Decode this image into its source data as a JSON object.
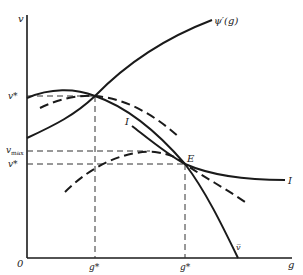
{
  "diagram": {
    "type": "economics-curve-diagram",
    "axes": {
      "y_label": "v",
      "x_label": "g",
      "origin_label": "0"
    },
    "y_ticks": [
      {
        "label": "v*",
        "id": "v-star-upper"
      },
      {
        "label": "v",
        "sub": "max",
        "id": "v-max"
      },
      {
        "label": "v*",
        "id": "v-star-lower"
      }
    ],
    "x_ticks": [
      {
        "label": "g*",
        "id": "g-star-left"
      },
      {
        "label": "g*",
        "id": "g-star-right"
      }
    ],
    "curve_labels": {
      "psi": "ψ′(g)",
      "indifference_left": "I",
      "indifference_right": "I",
      "equilibrium": "E",
      "v_bar": "v̅"
    },
    "curves": [
      {
        "name": "psi-prime-curve",
        "style": "solid",
        "description": "rising curve labeled psi'(g)"
      },
      {
        "name": "hump-curve",
        "style": "solid",
        "description": "hump-shaped curve falling to v-bar on g axis"
      },
      {
        "name": "upper-dashed-curve",
        "style": "dashed",
        "description": "dashed curve tangent at (g*, v*)"
      },
      {
        "name": "lower-dashed-curve",
        "style": "dashed",
        "description": "dashed curve with peak at v_max, through E"
      },
      {
        "name": "indifference-curve",
        "style": "solid",
        "description": "indifference curve I tangent at E"
      }
    ]
  }
}
